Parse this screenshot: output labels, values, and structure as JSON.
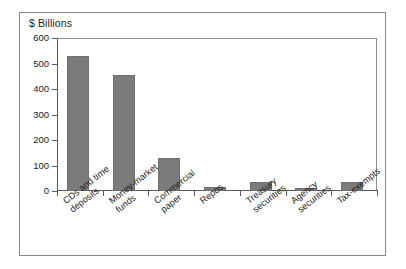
{
  "figure": {
    "title": "$ Billions",
    "frame_color": "#8a8a8a",
    "bar_color": "#7b7b7b",
    "axis_color": "#5a5a5a",
    "background": "#ffffff"
  },
  "chart_data": {
    "type": "bar",
    "title": "$ Billions",
    "xlabel": "",
    "ylabel": "$ Billions",
    "ylim": [
      0,
      600
    ],
    "yticks": [
      0,
      100,
      200,
      300,
      400,
      500,
      600
    ],
    "ytick_labels": [
      "0",
      "100",
      "200",
      "300",
      "400",
      "500",
      "600"
    ],
    "grid": false,
    "legend": false,
    "categories": [
      "CDs and time deposits",
      "Money-market funds",
      "Commercial paper",
      "Repos",
      "Treasury securities",
      "Agency securities",
      "Tax-exempts"
    ],
    "category_lines": [
      [
        "CDs and time",
        "deposits"
      ],
      [
        "Money-market",
        "funds"
      ],
      [
        "Commercial",
        "paper"
      ],
      [
        "Repos",
        ""
      ],
      [
        "Treasury",
        "securities"
      ],
      [
        "Agency",
        "securities"
      ],
      [
        "Tax-exempts",
        ""
      ]
    ],
    "values": [
      530,
      453,
      128,
      15,
      37,
      13,
      35
    ]
  }
}
